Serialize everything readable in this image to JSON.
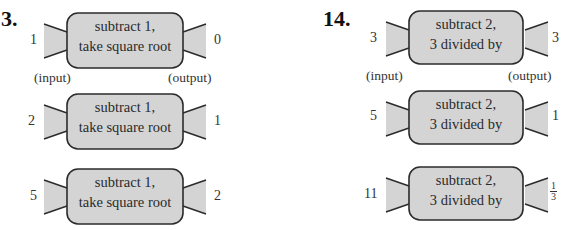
{
  "problems": [
    {
      "number": "3.",
      "labels": {
        "input": "(input)",
        "output": "(output)"
      },
      "machine_text": [
        "subtract 1,",
        "take square root"
      ],
      "rows": [
        {
          "input": "1",
          "output": "0"
        },
        {
          "input": "2",
          "output": "1"
        },
        {
          "input": "5",
          "output": "2"
        }
      ]
    },
    {
      "number": "14.",
      "labels": {
        "input": "(input)",
        "output": "(output)"
      },
      "machine_text": [
        "subtract 2,",
        "3 divided by"
      ],
      "rows": [
        {
          "input": "3",
          "output": "3"
        },
        {
          "input": "5",
          "output": "1"
        },
        {
          "input": "11",
          "output_fraction": {
            "numerator": "1",
            "denominator": "3"
          }
        }
      ]
    }
  ],
  "colors": {
    "machine_fill": "#d4d4d4",
    "stroke": "#2b2b2b"
  }
}
